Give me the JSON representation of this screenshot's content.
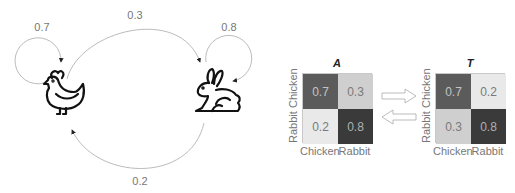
{
  "states": [
    {
      "name": "Chicken",
      "icon": "chicken-icon"
    },
    {
      "name": "Rabbit",
      "icon": "rabbit-icon"
    }
  ],
  "edges": {
    "chicken_to_chicken": "0.7",
    "chicken_to_rabbit": "0.3",
    "rabbit_to_rabbit": "0.8",
    "rabbit_to_chicken": "0.2"
  },
  "matrix_a": {
    "title": "A",
    "row_labels": [
      "Chicken",
      "Rabbit"
    ],
    "col_labels": [
      "Chicken",
      "Rabbit"
    ],
    "cells": [
      [
        "0.7",
        "0.3"
      ],
      [
        "0.2",
        "0.8"
      ]
    ],
    "colors": [
      [
        "#5b5b5b",
        "#cfcfcf"
      ],
      [
        "#e9e9e9",
        "#3a3a3a"
      ]
    ]
  },
  "matrix_t": {
    "title": "T",
    "row_labels": [
      "Chicken",
      "Rabbit"
    ],
    "col_labels": [
      "Chicken",
      "Rabbit"
    ],
    "cells": [
      [
        "0.7",
        "0.2"
      ],
      [
        "0.3",
        "0.8"
      ]
    ],
    "colors": [
      [
        "#5b5b5b",
        "#e9e9e9"
      ],
      [
        "#cfcfcf",
        "#3a3a3a"
      ]
    ]
  },
  "transpose_arrows": [
    "arrow-right-icon",
    "arrow-left-icon"
  ]
}
